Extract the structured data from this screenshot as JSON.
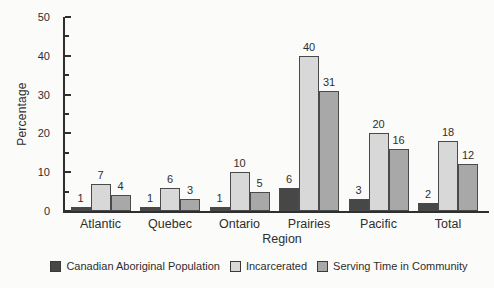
{
  "chart_data": {
    "type": "bar",
    "title": "",
    "xlabel": "Region",
    "ylabel": "Percentage",
    "ylim": [
      0,
      50
    ],
    "y_major_tick_step": 10,
    "y_minor_tick_step": 5,
    "y_tick_labels": [
      "0",
      "10",
      "20",
      "30",
      "40",
      "50"
    ],
    "categories": [
      "Atlantic",
      "Quebec",
      "Ontario",
      "Prairies",
      "Pacific",
      "Total"
    ],
    "series": [
      {
        "name": "Canadian Aboriginal Population",
        "color": "#474747",
        "values": [
          1,
          1,
          1,
          6,
          3,
          2
        ]
      },
      {
        "name": "Incarcerated",
        "color": "#d8d8d8",
        "values": [
          7,
          6,
          10,
          40,
          20,
          18
        ]
      },
      {
        "name": "Serving Time in Community",
        "color": "#a8a8a8",
        "values": [
          4,
          3,
          5,
          31,
          16,
          12
        ]
      }
    ],
    "value_labels": true,
    "grid": false,
    "legend_position": "bottom",
    "bar_border_color": "#4a4a4a",
    "axis_color": "#2f2f2f",
    "text_color": "#2e2e2e",
    "background_color": "#fbfbf9"
  }
}
